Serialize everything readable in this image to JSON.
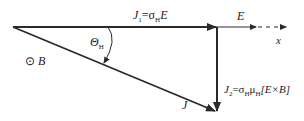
{
  "diagram": {
    "type": "vector-diagram",
    "colors": {
      "line": "#2a2a2a",
      "background": "#ffffff"
    },
    "labels": {
      "j1": {
        "base": "J",
        "sub": "1",
        "eq": "=σ",
        "eq_sub": "H",
        "rhs": "E"
      },
      "e": "E",
      "x": "x",
      "theta": {
        "base": "Θ",
        "sub": "H"
      },
      "b": {
        "symbol": "⊙",
        "text": "B"
      },
      "j": "J",
      "j2": {
        "base": "J",
        "sub": "2",
        "eq": "=σ",
        "eq_sub": "H",
        "mu": "μ",
        "mu_sub": "H",
        "rhs": "[E×B]"
      }
    }
  }
}
